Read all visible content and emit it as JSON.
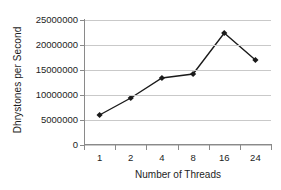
{
  "chart_data": {
    "type": "line",
    "title": "",
    "xlabel": "Number of Threads",
    "ylabel": "Dhrystones per Second",
    "categories": [
      "1",
      "2",
      "4",
      "8",
      "16",
      "24"
    ],
    "values": [
      6000000,
      9400000,
      13400000,
      14200000,
      22400000,
      17000000
    ],
    "ylim": [
      0,
      25000000
    ],
    "ytick_labels": [
      "0",
      "5000000",
      "10000000",
      "15000000",
      "20000000",
      "25000000"
    ],
    "ytick_values": [
      0,
      5000000,
      10000000,
      15000000,
      20000000,
      25000000
    ],
    "grid": true,
    "legend": "none",
    "series_name": "Dhrystones per Second",
    "colors": {
      "line": "#1a1a1a",
      "marker": "#1a1a1a",
      "gridline": "#c9c9c9",
      "axis": "#8a8a8a",
      "text": "#1d1d1d",
      "background": "#ffffff"
    }
  }
}
